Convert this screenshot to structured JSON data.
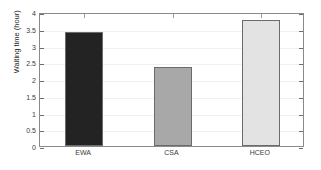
{
  "chart_data": {
    "type": "bar",
    "title": "",
    "subtitle": "",
    "xlabel": "",
    "ylabel": "Waiting time (hour)",
    "categories": [
      "EWA",
      "CSA",
      "HCEO"
    ],
    "values": [
      3.4,
      2.37,
      3.75
    ],
    "series": [
      {
        "name": "Waiting time",
        "values": [
          3.4,
          2.37,
          3.75
        ]
      }
    ],
    "bar_colors": [
      "#232323",
      "#a8a8a8",
      "#e3e3e3"
    ],
    "bar_edge_color": "#6b6b6b",
    "ylim": [
      0,
      4
    ],
    "xlim": [
      0.5,
      3.5
    ],
    "ytick_labels": [
      "0",
      "0.5",
      "1",
      "1.5",
      "2",
      "2.5",
      "3",
      "3.5",
      "4"
    ],
    "ytick_values": [
      0,
      0.5,
      1,
      1.5,
      2,
      2.5,
      3,
      3.5,
      4
    ],
    "xtick_labels": [
      "EWA",
      "CSA",
      "HCEO"
    ],
    "grid": "horizontal-faint",
    "legend": "none",
    "legend_position": "none",
    "axes_box": true,
    "background_color": "#ffffff",
    "axis_color": "#8a8a8a",
    "annotations": []
  }
}
